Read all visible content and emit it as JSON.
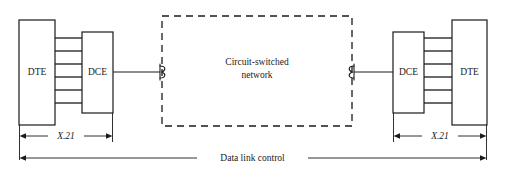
{
  "figure": {
    "kind": "network-interface-diagram",
    "background_color": "#ffffff",
    "ink_color": "#1a1a1a"
  },
  "nodes": {
    "dte_left_label": "DTE",
    "dce_left_label": "DCE",
    "dce_right_label": "DCE",
    "dte_right_label": "DTE"
  },
  "network": {
    "label_line1": "Circuit-switched",
    "label_line2": "network",
    "border_style": "dashed"
  },
  "dimensions": {
    "x21_left_label": "X.21",
    "x21_right_label": "X.21",
    "data_link_control_label": "Data link control"
  },
  "bus": {
    "conductor_count": 6
  }
}
